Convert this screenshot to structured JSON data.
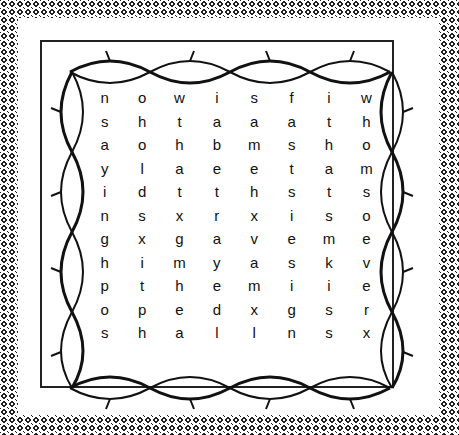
{
  "puzzle": {
    "type": "word-search",
    "rows": [
      [
        "n",
        "o",
        "w",
        "i",
        "s",
        "f",
        "i",
        "w"
      ],
      [
        "s",
        "h",
        "t",
        "a",
        "a",
        "a",
        "t",
        "h"
      ],
      [
        "a",
        "o",
        "h",
        "b",
        "m",
        "s",
        "h",
        "o"
      ],
      [
        "y",
        "l",
        "a",
        "e",
        "e",
        "t",
        "a",
        "m"
      ],
      [
        "i",
        "d",
        "t",
        "t",
        "h",
        "s",
        "t",
        "s"
      ],
      [
        "n",
        "s",
        "x",
        "r",
        "x",
        "i",
        "s",
        "o"
      ],
      [
        "g",
        "x",
        "g",
        "a",
        "v",
        "e",
        "m",
        "e"
      ],
      [
        "h",
        "i",
        "m",
        "y",
        "a",
        "s",
        "k",
        "v"
      ],
      [
        "p",
        "t",
        "h",
        "e",
        "m",
        "i",
        "i",
        "e"
      ],
      [
        "o",
        "p",
        "e",
        "d",
        "x",
        "g",
        "s",
        "r"
      ],
      [
        "s",
        "h",
        "a",
        "l",
        "l",
        "n",
        "s",
        "x"
      ]
    ],
    "border": "crown-of-thorns-vine",
    "background": "halftone-dot-pattern"
  }
}
